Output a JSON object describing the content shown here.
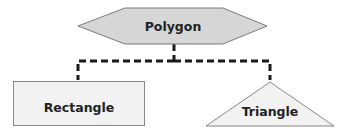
{
  "diagram": {
    "type": "hierarchy",
    "root": {
      "label": "Polygon",
      "shape": "hexagon",
      "fill": "#d6d6d6",
      "stroke": "#7a7a7a"
    },
    "children": [
      {
        "label": "Rectangle",
        "shape": "rectangle",
        "fill": "#f2f2f2",
        "stroke": "#888888"
      },
      {
        "label": "Triangle",
        "shape": "triangle",
        "fill": "#f2f2f2",
        "stroke": "#888888"
      }
    ],
    "connector": {
      "style": "dashed",
      "color": "#1a1a1a"
    }
  }
}
